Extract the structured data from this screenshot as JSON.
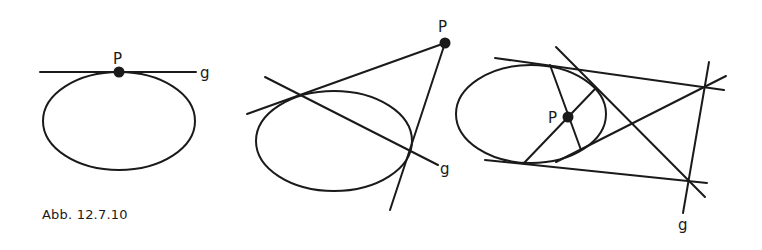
{
  "caption": "Abb. 12.7.10",
  "colors": {
    "ink": "#1a1a1a",
    "background": "#ffffff"
  },
  "figures": [
    {
      "id": "fig1",
      "description": "Point P on ellipse, g is the tangent",
      "labels": {
        "point": "P",
        "line": "g"
      },
      "ellipse": {
        "cx": 119,
        "cy": 121,
        "rx": 76,
        "ry": 49
      },
      "point": {
        "x": 119,
        "y": 72
      },
      "lines": [
        {
          "x1": 40,
          "y1": 72,
          "x2": 196,
          "y2": 72
        }
      ]
    },
    {
      "id": "fig2",
      "description": "Point P outside ellipse, g is the polar through the tangent points",
      "labels": {
        "point": "P",
        "line": "g"
      },
      "ellipse": {
        "cx": 334,
        "cy": 141,
        "rx": 78,
        "ry": 50
      },
      "point": {
        "x": 445,
        "y": 43
      },
      "lines": [
        {
          "x1": 247,
          "y1": 114,
          "x2": 445,
          "y2": 43
        },
        {
          "x1": 445,
          "y1": 43,
          "x2": 390,
          "y2": 210
        },
        {
          "x1": 265,
          "y1": 77,
          "x2": 438,
          "y2": 165
        }
      ]
    },
    {
      "id": "fig3",
      "description": "Point P inside ellipse, g is the polar constructed from tangent intersections",
      "labels": {
        "point": "P",
        "line": "g"
      },
      "ellipse": {
        "cx": 531,
        "cy": 114,
        "rx": 75,
        "ry": 49
      },
      "point": {
        "x": 568,
        "y": 117
      },
      "lines": [
        {
          "x1": 495,
          "y1": 58,
          "x2": 724,
          "y2": 90
        },
        {
          "x1": 485,
          "y1": 160,
          "x2": 707,
          "y2": 183
        },
        {
          "x1": 709,
          "y1": 62,
          "x2": 683,
          "y2": 213
        },
        {
          "x1": 556,
          "y1": 47,
          "x2": 705,
          "y2": 197
        },
        {
          "x1": 556,
          "y1": 162,
          "x2": 726,
          "y2": 76
        },
        {
          "x1": 550,
          "y1": 65,
          "x2": 581,
          "y2": 150
        },
        {
          "x1": 524,
          "y1": 163,
          "x2": 595,
          "y2": 89
        }
      ]
    }
  ]
}
